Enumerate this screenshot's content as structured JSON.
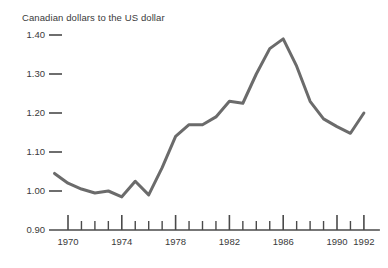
{
  "chart_data": {
    "type": "line",
    "title": "Canadian dollars to the US dollar",
    "xlabel": "",
    "ylabel": "",
    "grid": false,
    "legend": "none",
    "line_color": "#6b6b6b",
    "axis_color": "#4a4a4a",
    "xlim": [
      1969,
      1992.4
    ],
    "ylim": [
      0.9,
      1.4
    ],
    "ytick_labels": [
      "1.40",
      "1.30",
      "1.20",
      "1.10",
      "1.00",
      "0.90"
    ],
    "ytick_values": [
      1.4,
      1.3,
      1.2,
      1.1,
      1.0,
      0.9
    ],
    "xtick_labels": [
      "1970",
      "1974",
      "1978",
      "1982",
      "1986",
      "1990",
      "1992"
    ],
    "xtick_label_values": [
      1970,
      1974,
      1978,
      1982,
      1986,
      1990,
      1992
    ],
    "xtick_all_values": [
      1970,
      1971,
      1972,
      1973,
      1974,
      1975,
      1976,
      1977,
      1978,
      1979,
      1980,
      1981,
      1982,
      1983,
      1984,
      1985,
      1986,
      1987,
      1988,
      1989,
      1990,
      1991,
      1992
    ],
    "x": [
      1969,
      1970,
      1971,
      1972,
      1973,
      1974,
      1975,
      1976,
      1977,
      1978,
      1979,
      1980,
      1981,
      1982,
      1983,
      1984,
      1985,
      1986,
      1987,
      1988,
      1989,
      1990,
      1991,
      1992
    ],
    "values": [
      1.045,
      1.02,
      1.005,
      0.995,
      1.0,
      0.985,
      1.025,
      0.99,
      1.06,
      1.14,
      1.17,
      1.17,
      1.19,
      1.23,
      1.225,
      1.3,
      1.365,
      1.39,
      1.32,
      1.23,
      1.185,
      1.165,
      1.148,
      1.2
    ]
  }
}
